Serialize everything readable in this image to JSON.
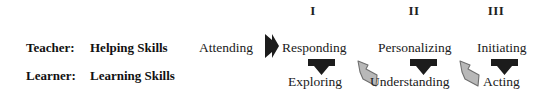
{
  "diagram": {
    "phase_numerals": [
      {
        "label": "I"
      },
      {
        "label": "II"
      },
      {
        "label": "III"
      }
    ],
    "rows": [
      {
        "role": "Teacher:",
        "skills": "Helping Skills"
      },
      {
        "role": "Learner:",
        "skills": "Learning Skills"
      }
    ],
    "teacher_stages": [
      {
        "label": "Attending"
      },
      {
        "label": "Responding"
      },
      {
        "label": "Personalizing"
      },
      {
        "label": "Initiating"
      }
    ],
    "learner_stages": [
      {
        "label": "Exploring"
      },
      {
        "label": "Understanding"
      },
      {
        "label": "Acting"
      }
    ],
    "arrows": {
      "right_arrow_label": "Attending leads to Responding",
      "down_arrow_labels": [
        "Responding leads to Exploring",
        "Personalizing leads to Understanding",
        "Initiating leads to Acting"
      ],
      "up_arrow_labels": [
        "Exploring leads to Personalizing",
        "Understanding leads to Initiating"
      ],
      "black_color": "#1c1c1c",
      "gray_color": "#b5b5b5"
    }
  }
}
